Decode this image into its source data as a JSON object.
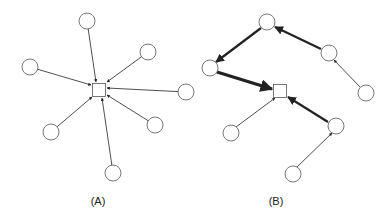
{
  "panels": [
    {
      "id": "A",
      "label": "(A)",
      "label_pos": [
        98,
        205
      ],
      "hub": {
        "x": 99,
        "y": 90,
        "size": 13
      },
      "nodes": [
        {
          "x": 87,
          "y": 21
        },
        {
          "x": 148,
          "y": 52
        },
        {
          "x": 30,
          "y": 67
        },
        {
          "x": 186,
          "y": 92
        },
        {
          "x": 155,
          "y": 125
        },
        {
          "x": 51,
          "y": 132
        },
        {
          "x": 113,
          "y": 173
        }
      ],
      "edges": [
        {
          "from": [
            87,
            21
          ],
          "to": [
            96,
            82
          ],
          "w": 0.8
        },
        {
          "from": [
            148,
            52
          ],
          "to": [
            107,
            82
          ],
          "w": 0.8
        },
        {
          "from": [
            30,
            67
          ],
          "to": [
            91,
            85
          ],
          "w": 0.8
        },
        {
          "from": [
            186,
            92
          ],
          "to": [
            107,
            88
          ],
          "w": 0.8
        },
        {
          "from": [
            155,
            125
          ],
          "to": [
            107,
            95
          ],
          "w": 0.8
        },
        {
          "from": [
            51,
            132
          ],
          "to": [
            92,
            97
          ],
          "w": 0.8
        },
        {
          "from": [
            113,
            173
          ],
          "to": [
            102,
            98
          ],
          "w": 0.8
        }
      ]
    },
    {
      "id": "B",
      "label": "(B)",
      "label_pos": [
        276,
        205
      ],
      "hub": {
        "x": 280,
        "y": 91,
        "size": 13
      },
      "nodes": [
        {
          "x": 267,
          "y": 22
        },
        {
          "x": 210,
          "y": 68
        },
        {
          "x": 329,
          "y": 53
        },
        {
          "x": 366,
          "y": 93
        },
        {
          "x": 231,
          "y": 133
        },
        {
          "x": 336,
          "y": 126
        },
        {
          "x": 293,
          "y": 174
        }
      ],
      "edges": [
        {
          "from": [
            321,
            49
          ],
          "to": [
            275,
            27
          ],
          "w": 2.2
        },
        {
          "from": [
            261,
            28
          ],
          "to": [
            216,
            62
          ],
          "w": 2.2
        },
        {
          "from": [
            217,
            72
          ],
          "to": [
            272,
            89
          ],
          "w": 3.2
        },
        {
          "from": [
            360,
            87
          ],
          "to": [
            334,
            60
          ],
          "w": 0.8
        },
        {
          "from": [
            328,
            122
          ],
          "to": [
            288,
            97
          ],
          "w": 2.2
        },
        {
          "from": [
            236,
            127
          ],
          "to": [
            275,
            98
          ],
          "w": 0.8
        },
        {
          "from": [
            297,
            167
          ],
          "to": [
            332,
            133
          ],
          "w": 0.8
        }
      ]
    }
  ],
  "style": {
    "node_radius": 8,
    "stroke": "#555555",
    "edge": "#222222"
  }
}
